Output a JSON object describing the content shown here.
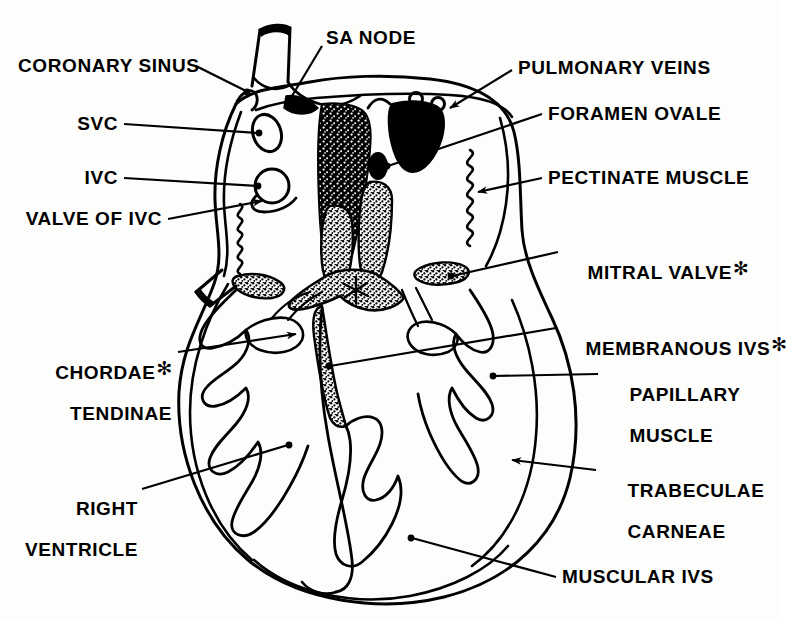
{
  "figure": {
    "ink_color": "#000000",
    "background_color": "#fdfdfc"
  },
  "labels": {
    "coronary_sinus": "CORONARY SINUS",
    "svc": "SVC",
    "ivc": "IVC",
    "valve_of_ivc": "VALVE OF IVC",
    "sa_node": "SA NODE",
    "pulmonary_veins": "PULMONARY VEINS",
    "foramen_ovale": "FORAMEN OVALE",
    "pectinate_muscle": "PECTINATE MUSCLE",
    "mitral_valve": "MITRAL VALVE",
    "mitral_valve_mark": "✻",
    "membranous_ivs": "MEMBRANOUS IVS",
    "membranous_ivs_mark": "✻",
    "chordae_line1": "CHORDAE",
    "chordae_mark": "✻",
    "chordae_line2": "TENDINAE",
    "papillary_line1": "PAPILLARY",
    "papillary_line2": "MUSCLE",
    "right_ventricle_line1": "RIGHT",
    "right_ventricle_line2": "VENTRICLE",
    "trabeculae_line1": "TRABECULAE",
    "trabeculae_line2": "CARNEAE",
    "muscular_ivs": "MUSCULAR IVS"
  }
}
